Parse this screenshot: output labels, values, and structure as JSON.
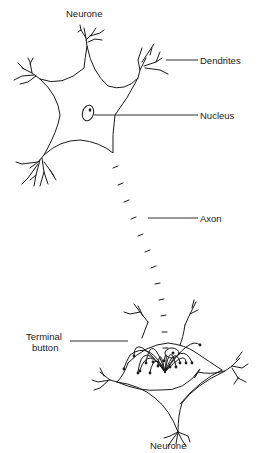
{
  "diagram": {
    "type": "labeled-illustration",
    "labels": {
      "top_neurone": "Neurone",
      "dendrites": "Dendrites",
      "nucleus": "Nucleus",
      "axon": "Axon",
      "terminal_button_line1": "Terminal",
      "terminal_button_line2": "button",
      "bottom_neurone": "Neurone"
    },
    "nodes": [
      {
        "id": "neurone-1",
        "label": "Neurone",
        "position": "top"
      },
      {
        "id": "dendrites",
        "label": "Dendrites"
      },
      {
        "id": "nucleus",
        "label": "Nucleus"
      },
      {
        "id": "axon",
        "label": "Axon"
      },
      {
        "id": "terminal-button",
        "label": "Terminal button"
      },
      {
        "id": "neurone-2",
        "label": "Neurone",
        "position": "bottom"
      }
    ],
    "edges": [
      {
        "from": "neurone-1",
        "to": "axon"
      },
      {
        "from": "axon",
        "to": "terminal-button"
      },
      {
        "from": "terminal-button",
        "to": "neurone-2"
      }
    ],
    "colors": {
      "ink": "#1a1a1a",
      "background": "#ffffff",
      "stipple": "#b0b0b0"
    }
  }
}
